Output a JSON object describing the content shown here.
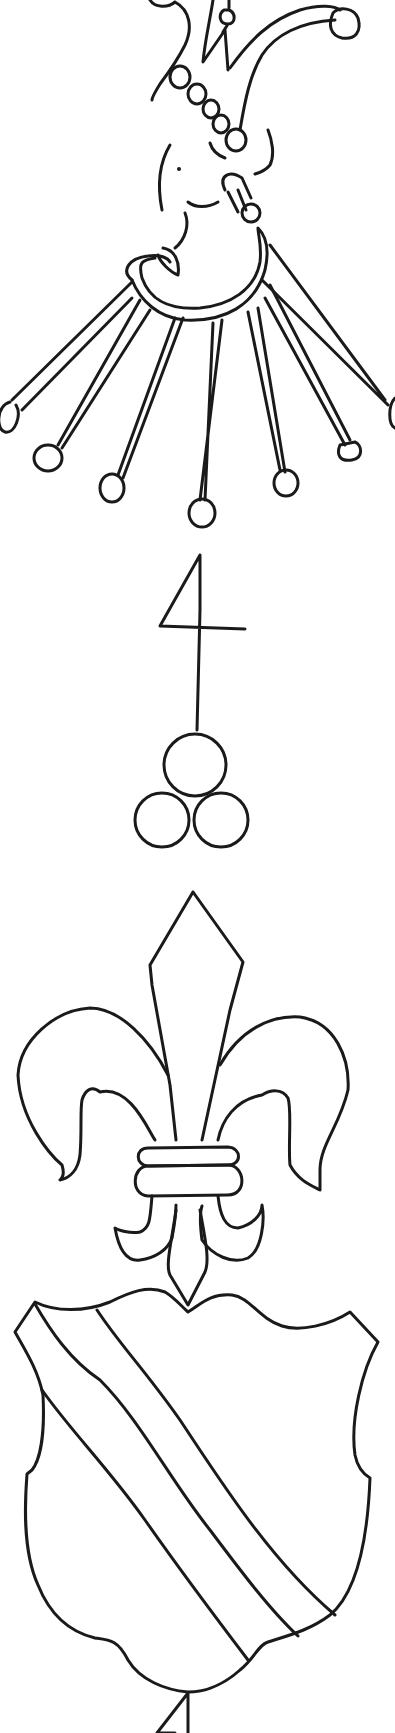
{
  "image": {
    "description": "Line-drawing tracing of a watermark: jester head with collar of bells, numeral 4 with three circles, fleur-de-lis, and a shield with a diagonal bend",
    "background_color": "#ffffff",
    "ink_color": "#1a1a1a",
    "motifs": [
      {
        "name": "jester-head",
        "details": "fool's cap with bells and pearl band, face with eye and smile, pipe, collar with seven bell-tipped points"
      },
      {
        "name": "numeral-four",
        "details": "stylized 4 on a vertical staff hanging from the center bell"
      },
      {
        "name": "three-circles",
        "details": "three circles arranged in a triangle at the end of the staff"
      },
      {
        "name": "fleur-de-lis",
        "details": "three-petal lily bound with a double band"
      },
      {
        "name": "shield",
        "details": "escutcheon with a diagonal bend from upper left to lower right"
      },
      {
        "name": "stem-fragment",
        "details": "partial line below the shield at image bottom edge"
      }
    ]
  }
}
